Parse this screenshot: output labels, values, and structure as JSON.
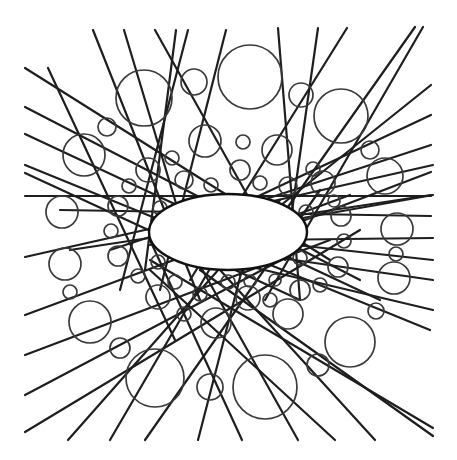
{
  "figure": {
    "title": "",
    "stroke_color": "#1e1e1e",
    "circle_color": "#3a3a3a",
    "background": "#ffffff",
    "ellipse": {
      "cx": 228,
      "cy": 232,
      "rx": 79,
      "ry": 38
    },
    "lines": [
      [
        48,
        68,
        175,
        340
      ],
      [
        93,
        30,
        200,
        300
      ],
      [
        124,
        30,
        190,
        250
      ],
      [
        155,
        30,
        250,
        200
      ],
      [
        176,
        30,
        145,
        270
      ],
      [
        188,
        30,
        120,
        290
      ],
      [
        226,
        30,
        160,
        290
      ],
      [
        278,
        28,
        300,
        300
      ],
      [
        318,
        28,
        285,
        260
      ],
      [
        347,
        28,
        190,
        280
      ],
      [
        415,
        27,
        240,
        275
      ],
      [
        423,
        27,
        265,
        300
      ],
      [
        431,
        85,
        200,
        270
      ],
      [
        431,
        115,
        165,
        240
      ],
      [
        431,
        145,
        110,
        250
      ],
      [
        431,
        172,
        200,
        260
      ],
      [
        431,
        195,
        70,
        250
      ],
      [
        431,
        196,
        25,
        196
      ],
      [
        431,
        216,
        60,
        210
      ],
      [
        25,
        68,
        330,
        260
      ],
      [
        25,
        107,
        360,
        280
      ],
      [
        25,
        134,
        380,
        300
      ],
      [
        25,
        165,
        430,
        330
      ],
      [
        25,
        173,
        300,
        300
      ],
      [
        25,
        257,
        433,
        165
      ],
      [
        25,
        315,
        350,
        195
      ],
      [
        25,
        355,
        330,
        240
      ],
      [
        25,
        395,
        300,
        250
      ],
      [
        25,
        432,
        360,
        230
      ],
      [
        68,
        440,
        280,
        200
      ],
      [
        110,
        440,
        250,
        200
      ],
      [
        145,
        440,
        320,
        190
      ],
      [
        198,
        440,
        260,
        200
      ],
      [
        242,
        440,
        150,
        240
      ],
      [
        298,
        440,
        180,
        230
      ],
      [
        335,
        440,
        150,
        270
      ],
      [
        375,
        440,
        220,
        270
      ],
      [
        433,
        428,
        150,
        260
      ],
      [
        433,
        436,
        200,
        270
      ],
      [
        433,
        260,
        250,
        240
      ],
      [
        433,
        238,
        260,
        240
      ],
      [
        433,
        195,
        150,
        245
      ],
      [
        433,
        280,
        190,
        245
      ],
      [
        433,
        310,
        180,
        250
      ]
    ],
    "circles": [
      [
        250,
        77,
        32
      ],
      [
        144,
        98,
        28
      ],
      [
        194,
        82,
        13
      ],
      [
        301,
        95,
        12
      ],
      [
        341,
        116,
        27
      ],
      [
        84,
        155,
        21
      ],
      [
        107,
        127,
        9
      ],
      [
        62,
        212,
        16
      ],
      [
        65,
        264,
        16
      ],
      [
        70,
        292,
        7
      ],
      [
        90,
        322,
        21
      ],
      [
        120,
        348,
        10
      ],
      [
        155,
        378,
        29
      ],
      [
        210,
        387,
        13
      ],
      [
        265,
        387,
        32
      ],
      [
        318,
        365,
        11
      ],
      [
        350,
        342,
        25
      ],
      [
        376,
        311,
        8
      ],
      [
        394,
        278,
        16
      ],
      [
        396,
        254,
        7
      ],
      [
        397,
        229,
        16
      ],
      [
        385,
        176,
        18
      ],
      [
        370,
        150,
        9
      ],
      [
        205,
        141,
        16
      ],
      [
        243,
        142,
        7
      ],
      [
        277,
        150,
        15
      ],
      [
        172,
        158,
        7
      ],
      [
        148,
        170,
        12
      ],
      [
        313,
        169,
        7
      ],
      [
        323,
        183,
        12
      ],
      [
        129,
        186,
        7
      ],
      [
        334,
        201,
        6
      ],
      [
        118,
        206,
        10
      ],
      [
        111,
        231,
        7
      ],
      [
        341,
        216,
        10
      ],
      [
        344,
        241,
        7
      ],
      [
        118,
        256,
        10
      ],
      [
        138,
        276,
        7
      ],
      [
        338,
        267,
        10
      ],
      [
        320,
        285,
        7
      ],
      [
        158,
        297,
        12
      ],
      [
        184,
        314,
        7
      ],
      [
        216,
        323,
        15
      ],
      [
        248,
        298,
        12
      ],
      [
        288,
        314,
        15
      ],
      [
        270,
        300,
        7
      ],
      [
        300,
        290,
        10
      ],
      [
        240,
        170,
        10
      ],
      [
        211,
        185,
        7
      ],
      [
        184,
        180,
        9
      ],
      [
        288,
        186,
        9
      ],
      [
        260,
        183,
        7
      ],
      [
        160,
        208,
        7
      ],
      [
        306,
        212,
        7
      ],
      [
        158,
        262,
        7
      ],
      [
        175,
        282,
        7
      ],
      [
        300,
        258,
        7
      ],
      [
        228,
        282,
        7
      ],
      [
        200,
        294,
        7
      ],
      [
        250,
        281,
        6
      ],
      [
        275,
        280,
        6
      ]
    ]
  }
}
